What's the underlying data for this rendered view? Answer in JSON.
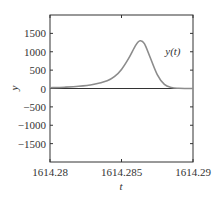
{
  "chart_data": {
    "type": "line",
    "title": "",
    "xlabel": "t",
    "ylabel": "y",
    "xlim": [
      1614.28,
      1614.29
    ],
    "ylim": [
      -2000,
      2000
    ],
    "grid": false,
    "legend": null,
    "x_ticks": [
      1614.28,
      1614.285,
      1614.29
    ],
    "x_tick_labels": [
      "1614.28",
      "1614.285",
      "1614.29"
    ],
    "y_ticks": [
      -1500,
      -1000,
      -500,
      0,
      500,
      1000,
      1500
    ],
    "y_tick_labels": [
      "−1500",
      "−1000",
      "−500",
      "0",
      "500",
      "1000",
      "1500"
    ],
    "annotations": [
      {
        "text": "y(t)",
        "x": 1614.2875,
        "y": 750
      }
    ],
    "series": [
      {
        "name": "y(t)",
        "color": "#8c8c8c",
        "x": [
          1614.28,
          1614.281,
          1614.282,
          1614.283,
          1614.284,
          1614.2845,
          1614.285,
          1614.2855,
          1614.286,
          1614.2863,
          1614.2866,
          1614.287,
          1614.2875,
          1614.288,
          1614.2885,
          1614.289,
          1614.2895,
          1614.29
        ],
        "values": [
          20,
          35,
          60,
          110,
          210,
          320,
          520,
          820,
          1180,
          1300,
          1220,
          850,
          380,
          110,
          25,
          5,
          0,
          0
        ]
      }
    ],
    "zero_line": true
  }
}
